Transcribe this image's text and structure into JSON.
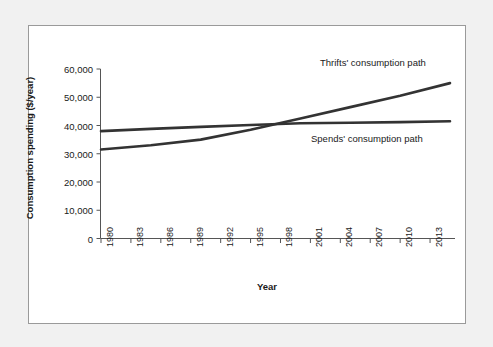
{
  "figure": {
    "background_color": "#f1f1f1",
    "panel_color": "#ffffff",
    "border_color": "#9a9a9a"
  },
  "chart_data": {
    "type": "line",
    "title": "",
    "xlabel": "Year",
    "ylabel": "Consumption spending ($/year)",
    "xlim": [
      1980,
      2015
    ],
    "ylim": [
      0,
      60000
    ],
    "grid": false,
    "legend_position": "inline-annotations",
    "x_tick_labels": [
      "1980",
      "1983",
      "1986",
      "1989",
      "1992",
      "1995",
      "1998",
      "2001",
      "2004",
      "2007",
      "2010",
      "2013"
    ],
    "x_tick_values": [
      1980,
      1983,
      1986,
      1989,
      1992,
      1995,
      1998,
      2001,
      2004,
      2007,
      2010,
      2013
    ],
    "y_tick_labels": [
      "0",
      "10,000",
      "20,000",
      "30,000",
      "40,000",
      "50,000",
      "60,000"
    ],
    "y_tick_values": [
      0,
      10000,
      20000,
      30000,
      40000,
      50000,
      60000
    ],
    "series": [
      {
        "name": "Thrifts' consumption path",
        "color": "#333333",
        "x": [
          1980,
          1985,
          1990,
          1995,
          2000,
          2005,
          2010,
          2015
        ],
        "values": [
          31500,
          33000,
          35000,
          38500,
          42500,
          46500,
          50500,
          55000
        ]
      },
      {
        "name": "Spends' consumption path",
        "color": "#333333",
        "x": [
          1980,
          1985,
          1990,
          1995,
          2000,
          2005,
          2010,
          2015
        ],
        "values": [
          38000,
          38800,
          39500,
          40200,
          40800,
          41000,
          41200,
          41500
        ]
      }
    ],
    "annotations": [
      {
        "text": "Thrifts' consumption path",
        "x": 2003,
        "y": 57000
      },
      {
        "text": "Spends' consumption path",
        "x": 2001,
        "y": 30500
      }
    ],
    "crossing_point": {
      "x": 1996,
      "y": 40000
    }
  }
}
